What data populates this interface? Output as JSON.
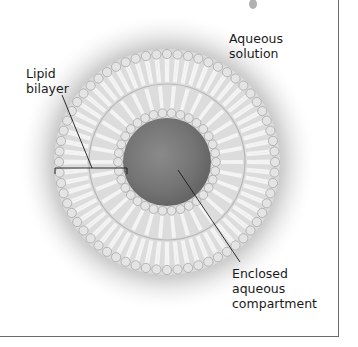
{
  "figure": {
    "labels": {
      "aqueous_solution": "Aqueous\nsolution",
      "lipid_bilayer": "Lipid\nbilayer",
      "enclosed_compartment": "Enclosed\naqueous\ncompartment"
    },
    "colors": {
      "background": "#ffffff",
      "halo": "#8c8c8c",
      "lipid": "#e6e6e6",
      "head_group": "#d2d2d2",
      "core_outer": "#6e6e6e",
      "core_inner": "#9a9a9a",
      "leader_line": "#1a1a1a",
      "frame": "#6a6a6a"
    },
    "geometry": {
      "center": [
        167,
        162
      ],
      "outer_radius": 115,
      "midline_radius": 78,
      "inner_radius": 46
    }
  }
}
